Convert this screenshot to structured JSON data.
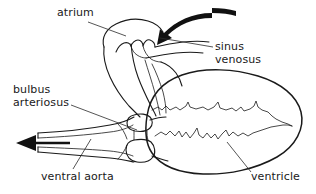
{
  "figure": {
    "background_color": "#ffffff",
    "line_color": "#1a1a1a",
    "labels": [
      {
        "id": "atrium",
        "text": "atrium",
        "x": 57,
        "y": 7
      },
      {
        "id": "sinus-venosus",
        "line1": "sinus",
        "line2": "venosus",
        "x": 215,
        "y": 41
      },
      {
        "id": "bulbus-arteriosus",
        "line1": "bulbus",
        "line2": "arteriosus",
        "x": 13,
        "y": 84
      },
      {
        "id": "ventral-aorta",
        "text": "ventral aorta",
        "x": 41,
        "y": 171
      },
      {
        "id": "ventricle",
        "text": "ventricle",
        "x": 251,
        "y": 171
      }
    ],
    "label_text": {
      "atrium": "atrium",
      "sinus_line1": "sinus",
      "sinus_line2": "venosus",
      "bulbus_line1": "bulbus",
      "bulbus_line2": "arteriosus",
      "ventral_aorta": "ventral aorta",
      "ventricle": "ventricle"
    },
    "arrows": [
      {
        "id": "blood-inflow-arrow",
        "direction": "left-down",
        "description": "curved arrow entering sinus venosus"
      },
      {
        "id": "blood-outflow-arrow",
        "direction": "left",
        "description": "straight arrow exiting ventral aorta"
      }
    ],
    "structures": [
      "atrium",
      "sinus venosus",
      "bulbus arteriosus",
      "ventral aorta",
      "ventricle"
    ]
  }
}
